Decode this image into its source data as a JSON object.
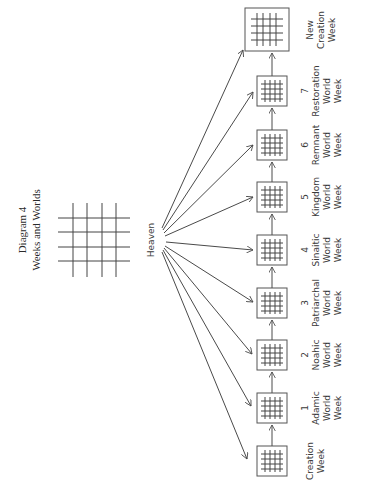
{
  "title": {
    "line1": "Diagram 4",
    "line2": "Weeks and Worlds"
  },
  "center_label": "Heaven",
  "colors": {
    "ink": "#444444",
    "background": "#ffffff"
  },
  "weeks": [
    {
      "number": "",
      "lines": [
        "Creation",
        "Week"
      ],
      "size": "small"
    },
    {
      "number": "1",
      "lines": [
        "Adamic",
        "World",
        "Week"
      ],
      "size": "small"
    },
    {
      "number": "2",
      "lines": [
        "Noahic",
        "World",
        "Week"
      ],
      "size": "small"
    },
    {
      "number": "3",
      "lines": [
        "Patriarchal",
        "World",
        "Week"
      ],
      "size": "small"
    },
    {
      "number": "4",
      "lines": [
        "Sinaitic",
        "World",
        "Week"
      ],
      "size": "small"
    },
    {
      "number": "5",
      "lines": [
        "Kingdom",
        "World",
        "Week"
      ],
      "size": "small"
    },
    {
      "number": "6",
      "lines": [
        "Remnant",
        "World",
        "Week"
      ],
      "size": "small"
    },
    {
      "number": "7",
      "lines": [
        "Restoration",
        "World",
        "Week"
      ],
      "size": "small"
    },
    {
      "number": "",
      "lines": [
        "New",
        "Creation",
        "Week"
      ],
      "size": "large"
    }
  ]
}
